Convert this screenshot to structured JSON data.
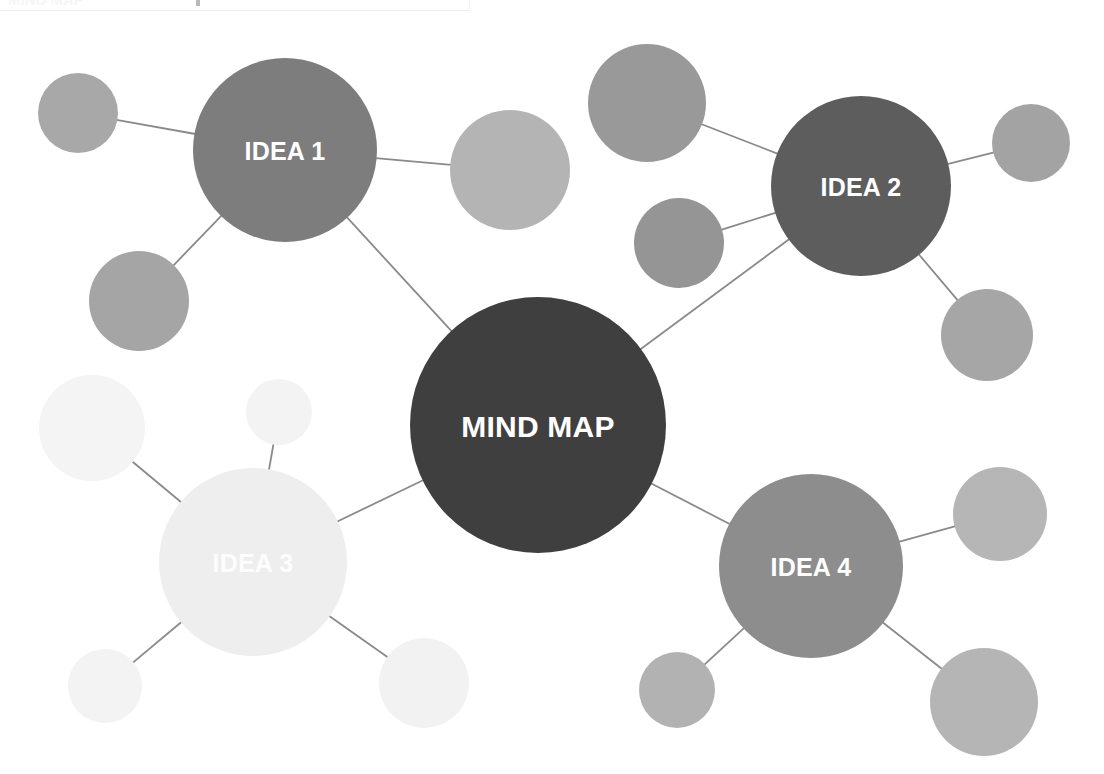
{
  "diagram": {
    "type": "mind-map",
    "title": "MIND MAP",
    "background_color": "#ffffff",
    "edge_color": "#8a8a8a",
    "label_color": "#ffffff"
  },
  "cropped_header": {
    "text": "MIND MAP",
    "note": "faint cut-off header strip at very top edge"
  },
  "central_node": {
    "label": "MIND MAP",
    "cx": 538,
    "cy": 425,
    "r": 128,
    "color": "#3f3f3f"
  },
  "idea_nodes": [
    {
      "id": "idea1",
      "label": "IDEA 1",
      "cx": 285,
      "cy": 150,
      "r": 92,
      "color": "#7d7d7d"
    },
    {
      "id": "idea2",
      "label": "IDEA 2",
      "cx": 861,
      "cy": 186,
      "r": 90,
      "color": "#5d5d5d"
    },
    {
      "id": "idea3",
      "label": "IDEA 3",
      "cx": 253,
      "cy": 562,
      "r": 94,
      "color": "#eeeeee"
    },
    {
      "id": "idea4",
      "label": "IDEA 4",
      "cx": 811,
      "cy": 566,
      "r": 92,
      "color": "#8d8d8d"
    }
  ],
  "satellite_nodes": [
    {
      "id": "s1a",
      "parent": "idea1",
      "cx": 78,
      "cy": 113,
      "r": 40,
      "color": "#a8a8a8"
    },
    {
      "id": "s1b",
      "parent": "idea1",
      "cx": 510,
      "cy": 170,
      "r": 60,
      "color": "#b4b4b4"
    },
    {
      "id": "s1c",
      "parent": "idea1",
      "cx": 139,
      "cy": 301,
      "r": 50,
      "color": "#a5a5a5"
    },
    {
      "id": "s2a",
      "parent": "idea2",
      "cx": 647,
      "cy": 103,
      "r": 59,
      "color": "#999999"
    },
    {
      "id": "s2b",
      "parent": "idea2",
      "cx": 679,
      "cy": 243,
      "r": 45,
      "color": "#959595"
    },
    {
      "id": "s2c",
      "parent": "idea2",
      "cx": 1031,
      "cy": 143,
      "r": 39,
      "color": "#a3a3a3"
    },
    {
      "id": "s2d",
      "parent": "idea2",
      "cx": 987,
      "cy": 335,
      "r": 46,
      "color": "#a6a6a6"
    },
    {
      "id": "s3a",
      "parent": "idea3",
      "cx": 92,
      "cy": 428,
      "r": 53,
      "color": "#f4f4f4"
    },
    {
      "id": "s3b",
      "parent": "idea3",
      "cx": 279,
      "cy": 412,
      "r": 33,
      "color": "#f3f3f3"
    },
    {
      "id": "s3c",
      "parent": "idea3",
      "cx": 105,
      "cy": 686,
      "r": 37,
      "color": "#f3f3f3"
    },
    {
      "id": "s3d",
      "parent": "idea3",
      "cx": 424,
      "cy": 683,
      "r": 45,
      "color": "#f2f2f2"
    },
    {
      "id": "s4a",
      "parent": "idea4",
      "cx": 1000,
      "cy": 514,
      "r": 47,
      "color": "#b6b6b6"
    },
    {
      "id": "s4b",
      "parent": "idea4",
      "cx": 677,
      "cy": 690,
      "r": 38,
      "color": "#b2b2b2"
    },
    {
      "id": "s4c",
      "parent": "idea4",
      "cx": 984,
      "cy": 702,
      "r": 54,
      "color": "#b5b5b5"
    }
  ],
  "edges": [
    {
      "from": "central",
      "to": "idea1"
    },
    {
      "from": "central",
      "to": "idea2"
    },
    {
      "from": "central",
      "to": "idea3"
    },
    {
      "from": "central",
      "to": "idea4"
    },
    {
      "from": "idea1",
      "to": "s1a"
    },
    {
      "from": "idea1",
      "to": "s1b"
    },
    {
      "from": "idea1",
      "to": "s1c"
    },
    {
      "from": "idea2",
      "to": "s2a"
    },
    {
      "from": "idea2",
      "to": "s2b"
    },
    {
      "from": "idea2",
      "to": "s2c"
    },
    {
      "from": "idea2",
      "to": "s2d"
    },
    {
      "from": "idea3",
      "to": "s3a"
    },
    {
      "from": "idea3",
      "to": "s3b"
    },
    {
      "from": "idea3",
      "to": "s3c"
    },
    {
      "from": "idea3",
      "to": "s3d"
    },
    {
      "from": "idea4",
      "to": "s4a"
    },
    {
      "from": "idea4",
      "to": "s4b"
    },
    {
      "from": "idea4",
      "to": "s4c"
    }
  ]
}
